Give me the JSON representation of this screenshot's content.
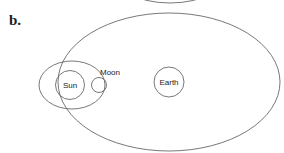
{
  "figure": {
    "panel_label": "b.",
    "labels": {
      "sun": "Sun",
      "moon": "Moon",
      "earth": "Earth"
    },
    "stroke_color": "#555555"
  }
}
